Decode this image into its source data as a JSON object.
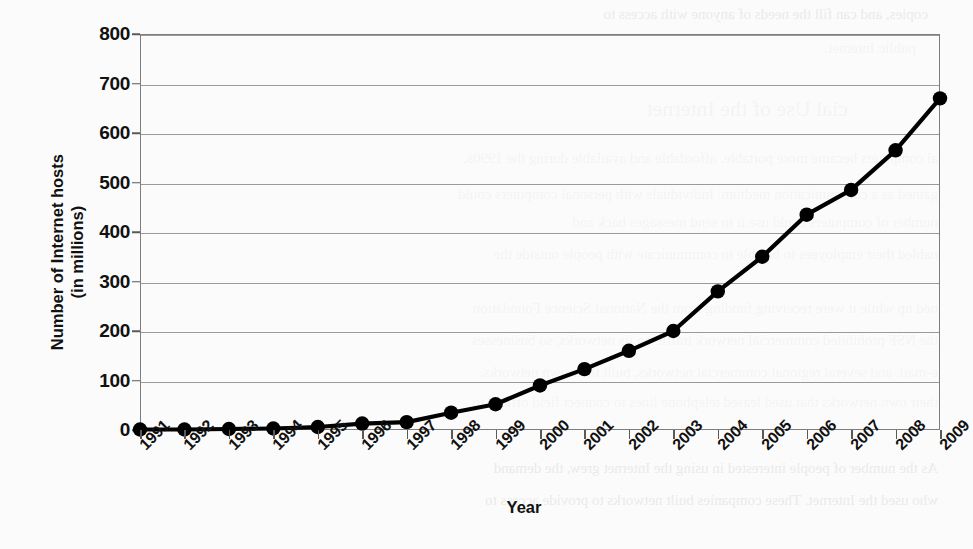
{
  "figure": {
    "kind": "scanned-textbook-line-chart",
    "x_axis_title": "Year",
    "y_axis_title_line1": "Number of Internet hosts",
    "y_axis_title_line2": "(in millions)",
    "line_color": "#000000",
    "marker_color": "#000000",
    "grid_color": "#9a9a9a",
    "frame_color": "#7d7d7d",
    "page_background": "#fbfbfb"
  },
  "chart_data": {
    "type": "line",
    "title": "",
    "subtitle": "",
    "xlabel": "Year",
    "ylabel": "Number of Internet hosts (in millions)",
    "categories": [
      "1991",
      "1992",
      "1993",
      "1994",
      "1995",
      "1996",
      "1997",
      "1998",
      "1999",
      "2000",
      "2001",
      "2002",
      "2003",
      "2004",
      "2005",
      "2006",
      "2007",
      "2008",
      "2009"
    ],
    "x": [
      1991,
      1992,
      1993,
      1994,
      1995,
      1996,
      1997,
      1998,
      1999,
      2000,
      2001,
      2002,
      2003,
      2004,
      2005,
      2006,
      2007,
      2008,
      2009
    ],
    "values": [
      1,
      1,
      2,
      3,
      6,
      13,
      16,
      35,
      52,
      90,
      123,
      160,
      200,
      280,
      350,
      435,
      485,
      565,
      670
    ],
    "ylim": [
      0,
      800
    ],
    "yticks": [
      0,
      100,
      200,
      300,
      400,
      500,
      600,
      700,
      800
    ],
    "ytick_labels": [
      "0",
      "100",
      "200",
      "300",
      "400",
      "500",
      "600",
      "700",
      "800"
    ],
    "grid": true,
    "grid_axis": "y",
    "legend": false,
    "legend_position": "none",
    "marker": "filled-circle",
    "series": [
      {
        "name": "Internet hosts",
        "values": [
          1,
          1,
          2,
          3,
          6,
          13,
          16,
          35,
          52,
          90,
          123,
          160,
          200,
          280,
          350,
          435,
          485,
          565,
          670
        ]
      }
    ]
  },
  "ghost_text": {
    "lines": [
      {
        "text": "copies, and can fill the needs of anyone with access to",
        "x": 40,
        "y": 6,
        "size": 15
      },
      {
        "text": "public Internet.",
        "x": 52,
        "y": 40,
        "size": 15
      },
      {
        "text": "cial Use of the Internet",
        "x": 120,
        "y": 96,
        "size": 22
      },
      {
        "text": "al computers became more portable, affordable and available during the 1990s,",
        "x": 30,
        "y": 150,
        "size": 15
      },
      {
        "text": "gained as a communication medium. Individuals with personal computers could",
        "x": 30,
        "y": 186,
        "size": 15
      },
      {
        "text": "number of computers could use it to send messages back and",
        "x": 30,
        "y": 214,
        "size": 15
      },
      {
        "text": "nabled their employees to be able to communicate with people outside the",
        "x": 30,
        "y": 246,
        "size": 15
      },
      {
        "text": "ned up while it were receiving funding from the National Science Foundation",
        "x": 30,
        "y": 300,
        "size": 15
      },
      {
        "text": "the NSF prohibited commercial network traffic on its networks, so businesses",
        "x": 30,
        "y": 332,
        "size": 15
      },
      {
        "text": "e-mail, and several regional commercial networks, built their own networks.",
        "x": 30,
        "y": 364,
        "size": 15
      },
      {
        "text": "their own networks that used leased telephone lines to connect field offices to",
        "x": 30,
        "y": 394,
        "size": 15
      },
      {
        "text": "As the number of people interested in using the Internet grew, the demand",
        "x": 30,
        "y": 460,
        "size": 15
      },
      {
        "text": "who used the Internet. These companies built networks to provide access to",
        "x": 30,
        "y": 492,
        "size": 15
      }
    ]
  }
}
